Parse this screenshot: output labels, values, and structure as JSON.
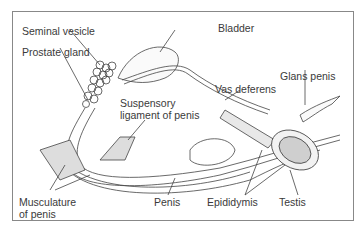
{
  "diagram": {
    "labels": {
      "seminal_vesicle": "Seminal vesicle",
      "prostate_gland": "Prostate gland",
      "bladder": "Bladder",
      "glans_penis": "Glans penis",
      "vas_deferens": "Vas deferens",
      "suspensory_1": "Suspensory",
      "suspensory_2": "ligament of penis",
      "musculature_1": "Musculature",
      "musculature_2": "of penis",
      "penis": "Penis",
      "epididymis": "Epididymis",
      "testis": "Testis"
    }
  }
}
